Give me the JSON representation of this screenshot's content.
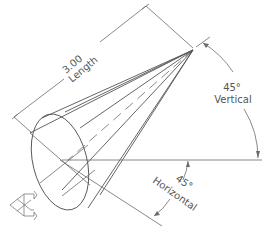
{
  "drawing": {
    "title": "Cone with length and angle dimensions",
    "length_dimension": {
      "value": "3.00",
      "label": "Length"
    },
    "vertical_angle": {
      "value": "45°",
      "label": "Vertical"
    },
    "horizontal_angle": {
      "value": "45°",
      "label": "Horizontal"
    },
    "colors": {
      "line": "#6b6b6b",
      "text": "#555555",
      "background": "#ffffff"
    }
  },
  "icons": {
    "orientation": "ucs-orientation-icon"
  }
}
